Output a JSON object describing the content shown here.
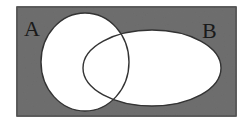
{
  "diagram": {
    "type": "venn",
    "universe": {
      "fill": "#6f6f6f",
      "stroke": "#2a2a2a",
      "x": 17,
      "y": 7,
      "width": 219,
      "height": 109
    },
    "sets": [
      {
        "label": "A",
        "cx": 85,
        "cy": 62,
        "rx": 44,
        "ry": 49,
        "label_x": 24,
        "label_y": 36
      },
      {
        "label": "B",
        "cx": 152,
        "cy": 68,
        "rx": 69,
        "ry": 38,
        "label_x": 202,
        "label_y": 38
      }
    ],
    "set_fill": "#ffffff",
    "outline_color": "#333333"
  }
}
